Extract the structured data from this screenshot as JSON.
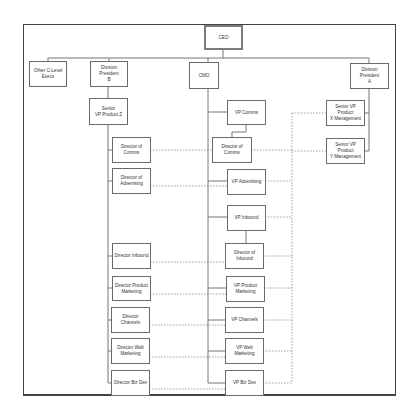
{
  "diagram": {
    "type": "org-chart",
    "nodes": {
      "ceo": "CEO",
      "other_c_level": "Other C-Level\nExecs",
      "div_pres_b": "Division President\nB",
      "cmo": "CMO",
      "div_pres_a": "Division President\nA",
      "svp_product_z": "Senior\nVP Product Z",
      "vp_comms": "VP Comms",
      "svp_product_x": "Senior VP Product\nX Management",
      "svp_product_y": "Senior VP Product\nY Management",
      "dir_comms_left": "Director of Comms",
      "dir_comms_center": "Director of Comms",
      "dir_advertising": "Director of\nAdvertising",
      "vp_advertising": "VP Advertising",
      "vp_inbound": "VP Inbound",
      "dir_inbound_left": "Director Inbound",
      "dir_inbound_center": "Director of\nInbound",
      "dir_product_marketing": "Director Product\nMarketing",
      "vp_product_marketing": "VP Product\nMarketing",
      "dir_channels": "Director Channels",
      "vp_channels": "VP Channels",
      "dir_web_marketing": "Director Web\nMarketing",
      "vp_web_marketing": "VP Web Marketing",
      "dir_biz_dev": "Director Biz Dev",
      "vp_biz_dev": "VP Biz Dev"
    },
    "solid_edges": [
      [
        "CEO",
        "Other C-Level Execs"
      ],
      [
        "CEO",
        "Division President B"
      ],
      [
        "CEO",
        "CMO"
      ],
      [
        "CEO",
        "Division President A"
      ],
      [
        "Division President B",
        "Senior VP Product Z"
      ],
      [
        "Senior VP Product Z",
        "Director of Comms"
      ],
      [
        "Senior VP Product Z",
        "Director of Advertising"
      ],
      [
        "Senior VP Product Z",
        "Director Inbound"
      ],
      [
        "Senior VP Product Z",
        "Director Product Marketing"
      ],
      [
        "Senior VP Product Z",
        "Director Channels"
      ],
      [
        "Senior VP Product Z",
        "Director Web Marketing"
      ],
      [
        "Senior VP Product Z",
        "Director Biz Dev"
      ],
      [
        "CMO",
        "VP Comms"
      ],
      [
        "VP Comms",
        "Director of Comms"
      ],
      [
        "CMO",
        "VP Advertising"
      ],
      [
        "CMO",
        "VP Inbound"
      ],
      [
        "VP Inbound",
        "Director of Inbound"
      ],
      [
        "CMO",
        "VP Product Marketing"
      ],
      [
        "CMO",
        "VP Channels"
      ],
      [
        "CMO",
        "VP Web Marketing"
      ],
      [
        "CMO",
        "VP Biz Dev"
      ],
      [
        "Division President A",
        "Senior VP Product X Management"
      ],
      [
        "Division President A",
        "Senior VP Product Y Management"
      ]
    ],
    "dotted_edges_note": "Dotted lines link each left-column director to its marketing counterpart and to the Senior VP Product X/Y Management boxes"
  }
}
